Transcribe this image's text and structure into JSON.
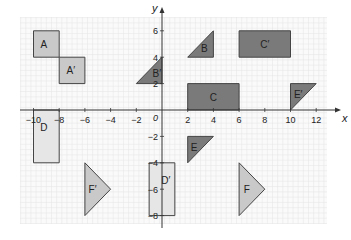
{
  "diagram": {
    "type": "coordinate-grid-transformations",
    "axes": {
      "x_label": "x",
      "y_label": "y",
      "origin_label": "0",
      "x_ticks": [
        -10,
        -8,
        -6,
        -4,
        -2,
        2,
        4,
        6,
        8,
        10,
        12
      ],
      "y_ticks": [
        6,
        4,
        2,
        -2,
        -4,
        -6,
        -8
      ],
      "x_range": [
        -11,
        13
      ],
      "y_range": [
        -9,
        7
      ]
    },
    "colors": {
      "light_fill": "#c9c9c9",
      "dark_fill": "#7a7a7a",
      "pale_fill": "#e6e6e6",
      "outline": "#444444",
      "grid_minor": "#e4e4e4",
      "grid_major": "#cfcfcf",
      "axis": "#333333"
    },
    "shapes": [
      {
        "label": "A",
        "kind": "polygon",
        "fill": "light",
        "points": [
          [
            -10,
            6
          ],
          [
            -8,
            6
          ],
          [
            -8,
            4
          ],
          [
            -10,
            4
          ]
        ],
        "label_at": [
          -9.2,
          5
        ]
      },
      {
        "label": "A′",
        "kind": "polygon",
        "fill": "light",
        "points": [
          [
            -8,
            4
          ],
          [
            -6,
            4
          ],
          [
            -6,
            2
          ],
          [
            -8,
            2
          ]
        ],
        "label_at": [
          -7.1,
          3
        ]
      },
      {
        "label": "B",
        "kind": "polygon",
        "fill": "dark",
        "points": [
          [
            2,
            4
          ],
          [
            4,
            6
          ],
          [
            4,
            4
          ]
        ],
        "label_at": [
          3.3,
          4.7
        ]
      },
      {
        "label": "B′",
        "kind": "polygon",
        "fill": "dark",
        "points": [
          [
            -2,
            2
          ],
          [
            0,
            4
          ],
          [
            0,
            2
          ]
        ],
        "label_at": [
          -0.4,
          2.8
        ]
      },
      {
        "label": "C",
        "kind": "polygon",
        "fill": "dark",
        "points": [
          [
            2,
            2
          ],
          [
            6,
            2
          ],
          [
            6,
            0
          ],
          [
            2,
            0
          ]
        ],
        "label_at": [
          4,
          1
        ]
      },
      {
        "label": "C′",
        "kind": "polygon",
        "fill": "dark",
        "points": [
          [
            6,
            6
          ],
          [
            10,
            6
          ],
          [
            10,
            4
          ],
          [
            6,
            4
          ]
        ],
        "label_at": [
          8,
          5
        ]
      },
      {
        "label": "D",
        "kind": "polygon",
        "fill": "pale",
        "points": [
          [
            -10,
            0
          ],
          [
            -8,
            0
          ],
          [
            -8,
            -4
          ],
          [
            -10,
            -4
          ]
        ],
        "label_at": [
          -9.2,
          -1.3
        ]
      },
      {
        "label": "D′",
        "kind": "polygon",
        "fill": "pale",
        "points": [
          [
            -1,
            -4
          ],
          [
            1,
            -4
          ],
          [
            1,
            -8
          ],
          [
            -1,
            -8
          ]
        ],
        "label_at": [
          0.3,
          -5.3
        ]
      },
      {
        "label": "E",
        "kind": "polygon",
        "fill": "dark",
        "points": [
          [
            2,
            -2
          ],
          [
            4,
            -2
          ],
          [
            2,
            -4
          ]
        ],
        "label_at": [
          2.5,
          -2.8
        ]
      },
      {
        "label": "E′",
        "kind": "polygon",
        "fill": "dark",
        "points": [
          [
            10,
            0
          ],
          [
            10,
            2
          ],
          [
            12,
            2
          ]
        ],
        "label_at": [
          10.6,
          1.2
        ]
      },
      {
        "label": "F",
        "kind": "polygon",
        "fill": "light",
        "points": [
          [
            6,
            -4
          ],
          [
            8,
            -6
          ],
          [
            6,
            -8
          ]
        ],
        "label_at": [
          6.6,
          -6
        ]
      },
      {
        "label": "F′",
        "kind": "polygon",
        "fill": "light",
        "points": [
          [
            -6,
            -4
          ],
          [
            -4,
            -6
          ],
          [
            -6,
            -8
          ]
        ],
        "label_at": [
          -5.4,
          -6
        ]
      }
    ]
  }
}
